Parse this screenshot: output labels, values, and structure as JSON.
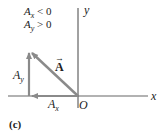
{
  "conditions": [
    {
      "symbol": "A",
      "sub": "x",
      "relation": "< 0"
    },
    {
      "symbol": "A",
      "sub": "y",
      "relation": "> 0"
    }
  ],
  "axes": {
    "x_label": "x",
    "y_label": "y",
    "origin_label": "O"
  },
  "vectors": {
    "main": {
      "label": "A",
      "arrow": "→"
    },
    "x_component": {
      "symbol": "A",
      "sub": "x"
    },
    "y_component": {
      "symbol": "A",
      "sub": "y"
    }
  },
  "panel_label": "(c)",
  "colors": {
    "axis": "#444444",
    "vector": "#8a8a8a",
    "text": "#222222"
  }
}
